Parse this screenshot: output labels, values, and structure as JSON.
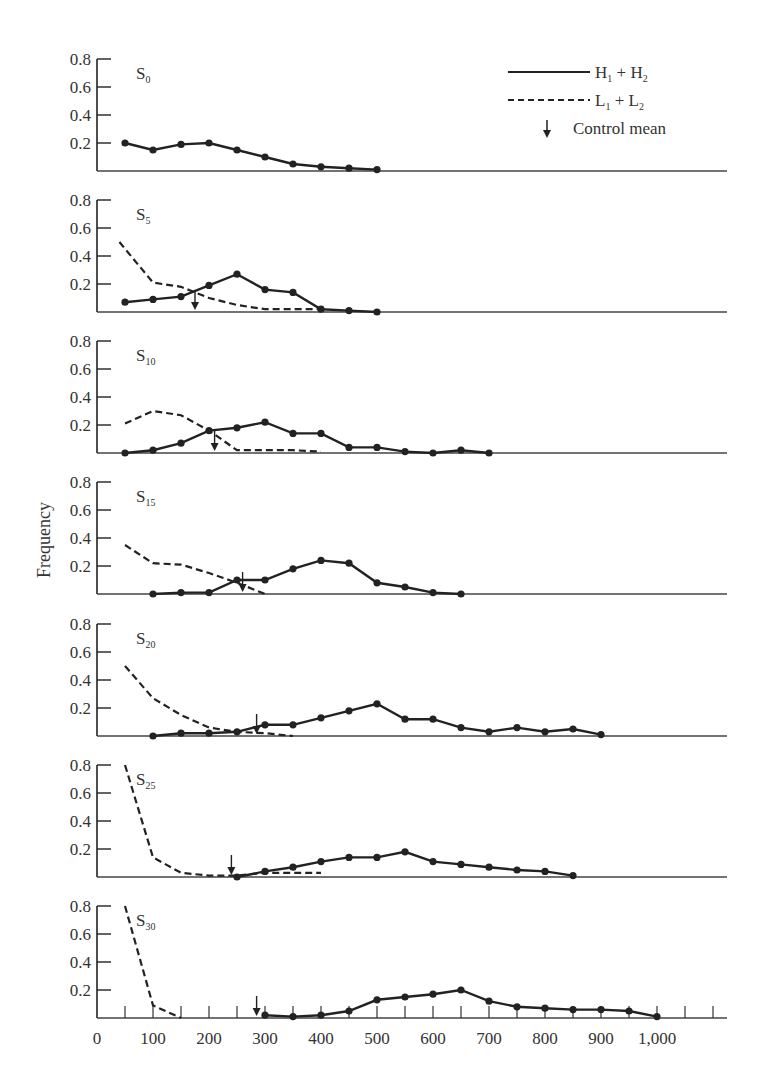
{
  "chart_data": {
    "type": "line",
    "title": "",
    "xlabel": "",
    "ylabel": "Frequency",
    "xlim": [
      0,
      1100
    ],
    "ylim": [
      0,
      0.8
    ],
    "x_ticks": [
      0,
      100,
      200,
      300,
      400,
      500,
      600,
      700,
      800,
      900,
      1000
    ],
    "x_tick_labels": [
      "0",
      "100",
      "200",
      "300",
      "400",
      "500",
      "600",
      "700",
      "800",
      "900",
      "1,000"
    ],
    "y_ticks": [
      0.2,
      0.4,
      0.6,
      0.8
    ],
    "y_tick_labels": [
      "0.2",
      "0.4",
      "0.6",
      "0.8"
    ],
    "legend": {
      "position": "top-right",
      "entries": [
        {
          "label_main": "H",
          "sub1": "1",
          "plus": " + ",
          "label_main2": "H",
          "sub2": "2",
          "style": "solid"
        },
        {
          "label_main": "L",
          "sub1": "1",
          "plus": " + ",
          "label_main2": "L",
          "sub2": "2",
          "style": "dashed"
        },
        {
          "label": "Control mean",
          "style": "arrow"
        }
      ]
    },
    "panels": [
      {
        "label": "S",
        "sub": "0",
        "H1_H2": {
          "x": [
            50,
            100,
            150,
            200,
            250,
            300,
            350,
            400,
            450,
            500
          ],
          "y": [
            0.2,
            0.15,
            0.19,
            0.2,
            0.15,
            0.1,
            0.05,
            0.03,
            0.02,
            0.01
          ]
        },
        "L1_L2": null,
        "control_mean": null
      },
      {
        "label": "S",
        "sub": "5",
        "H1_H2": {
          "x": [
            50,
            100,
            150,
            200,
            250,
            300,
            350,
            400,
            450,
            500
          ],
          "y": [
            0.07,
            0.09,
            0.11,
            0.19,
            0.27,
            0.16,
            0.14,
            0.02,
            0.01,
            0.0
          ]
        },
        "L1_L2": {
          "x": [
            40,
            100,
            150,
            200,
            250,
            300,
            350,
            400
          ],
          "y": [
            0.5,
            0.21,
            0.18,
            0.1,
            0.05,
            0.02,
            0.02,
            0.02
          ]
        },
        "control_mean": 175
      },
      {
        "label": "S",
        "sub": "10",
        "H1_H2": {
          "x": [
            50,
            100,
            150,
            200,
            250,
            300,
            350,
            400,
            450,
            500,
            550,
            600,
            650,
            700
          ],
          "y": [
            0.0,
            0.02,
            0.07,
            0.16,
            0.18,
            0.22,
            0.14,
            0.14,
            0.04,
            0.04,
            0.01,
            0.0,
            0.02,
            0.0
          ]
        },
        "L1_L2": {
          "x": [
            50,
            100,
            150,
            200,
            250,
            300,
            350,
            400
          ],
          "y": [
            0.21,
            0.3,
            0.27,
            0.16,
            0.02,
            0.02,
            0.02,
            0.01
          ]
        },
        "control_mean": 210
      },
      {
        "label": "S",
        "sub": "15",
        "H1_H2": {
          "x": [
            100,
            150,
            200,
            250,
            300,
            350,
            400,
            450,
            500,
            550,
            600,
            650
          ],
          "y": [
            0.0,
            0.01,
            0.01,
            0.1,
            0.1,
            0.18,
            0.24,
            0.22,
            0.08,
            0.05,
            0.01,
            0.0
          ]
        },
        "L1_L2": {
          "x": [
            50,
            100,
            150,
            200,
            250,
            300
          ],
          "y": [
            0.35,
            0.22,
            0.21,
            0.15,
            0.08,
            0.0
          ]
        },
        "control_mean": 260
      },
      {
        "label": "S",
        "sub": "20",
        "H1_H2": {
          "x": [
            100,
            150,
            200,
            250,
            300,
            350,
            400,
            450,
            500,
            550,
            600,
            650,
            700,
            750,
            800,
            850,
            900
          ],
          "y": [
            0.0,
            0.02,
            0.02,
            0.03,
            0.08,
            0.08,
            0.13,
            0.18,
            0.23,
            0.12,
            0.12,
            0.06,
            0.03,
            0.06,
            0.03,
            0.05,
            0.01
          ]
        },
        "L1_L2": {
          "x": [
            50,
            100,
            150,
            200,
            250,
            300,
            350
          ],
          "y": [
            0.5,
            0.27,
            0.15,
            0.06,
            0.03,
            0.02,
            0.0
          ]
        },
        "control_mean": 285
      },
      {
        "label": "S",
        "sub": "25",
        "H1_H2": {
          "x": [
            250,
            300,
            350,
            400,
            450,
            500,
            550,
            600,
            650,
            700,
            750,
            800,
            850
          ],
          "y": [
            0.0,
            0.04,
            0.07,
            0.11,
            0.14,
            0.14,
            0.18,
            0.11,
            0.09,
            0.07,
            0.05,
            0.04,
            0.01
          ]
        },
        "L1_L2": {
          "x": [
            50,
            100,
            150,
            200,
            250,
            300,
            350,
            400
          ],
          "y": [
            0.8,
            0.14,
            0.03,
            0.01,
            0.01,
            0.03,
            0.03,
            0.03
          ]
        },
        "control_mean": 240
      },
      {
        "label": "S",
        "sub": "30",
        "H1_H2": {
          "x": [
            300,
            350,
            400,
            450,
            500,
            550,
            600,
            650,
            700,
            750,
            800,
            850,
            900,
            950,
            1000
          ],
          "y": [
            0.02,
            0.01,
            0.02,
            0.05,
            0.13,
            0.15,
            0.17,
            0.2,
            0.12,
            0.08,
            0.07,
            0.06,
            0.06,
            0.05,
            0.01
          ]
        },
        "L1_L2": {
          "x": [
            50,
            100,
            150
          ],
          "y": [
            0.8,
            0.09,
            0.0
          ]
        },
        "control_mean": 285
      }
    ],
    "grid": false
  }
}
